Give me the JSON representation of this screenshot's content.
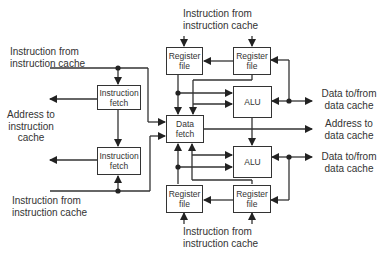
{
  "blocks": {
    "instruction_fetch_top": "Instruction fetch",
    "instruction_fetch_bottom": "Instruction fetch",
    "data_fetch": "Data fetch",
    "register_file_top_left": "Register file",
    "register_file_top_right": "Register file",
    "register_file_bottom_left": "Register file",
    "register_file_bottom_right": "Register file",
    "alu_top": "ALU",
    "alu_bottom": "ALU"
  },
  "labels": {
    "instr_from_cache_top": [
      "Instruction  from",
      "instruction cache"
    ],
    "instr_from_cache_left_top": [
      "Instruction  from",
      "instruction cache"
    ],
    "address_to_instr_cache": [
      "Address to",
      "instruction",
      "cache"
    ],
    "instr_from_cache_left_bottom": [
      "Instruction  from",
      "instruction cache"
    ],
    "instr_from_cache_bottom": [
      "Instruction  from",
      "instruction cache"
    ],
    "data_to_from_cache_top": [
      "Data to/from",
      "data cache"
    ],
    "address_to_data_cache": [
      "Address to",
      "data cache"
    ],
    "data_to_from_cache_bottom": [
      "Data to/from",
      "data cache"
    ]
  }
}
